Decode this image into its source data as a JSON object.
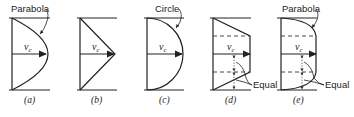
{
  "figure": {
    "panels": [
      {
        "id": "a",
        "label": "(a)",
        "profile": "parabola",
        "annotation": "Parabola",
        "velocity_label": "v_c"
      },
      {
        "id": "b",
        "label": "(b)",
        "profile": "triangle",
        "annotation": "",
        "velocity_label": "v_c"
      },
      {
        "id": "c",
        "label": "(c)",
        "profile": "circle",
        "annotation": "Circle",
        "velocity_label": "v_c"
      },
      {
        "id": "d",
        "label": "(d)",
        "profile": "trapezoid",
        "annotation": "Equal",
        "velocity_label": "v_c"
      },
      {
        "id": "e",
        "label": "(e)",
        "profile": "parabolic-flat",
        "annotation_top": "Parabola",
        "annotation": "Equal",
        "velocity_label": "v_c"
      }
    ],
    "vc_main": "v",
    "vc_sub": "c"
  }
}
